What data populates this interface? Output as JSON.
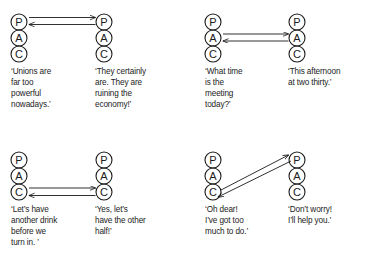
{
  "figure": {
    "background_color": "#ffffff",
    "stroke_color": "#1a1a1a",
    "ego_states": [
      "P",
      "A",
      "C"
    ],
    "ego_state_names": {
      "P": "Parent",
      "A": "Adult",
      "C": "Child"
    }
  },
  "panels": [
    {
      "id": "panel-parent-to-parent",
      "transaction_type": "complementary",
      "arrows": [
        {
          "from": "left-P",
          "to": "right-P",
          "direction": "left-to-right"
        },
        {
          "from": "right-P",
          "to": "left-P",
          "direction": "right-to-left"
        }
      ],
      "left_person": {
        "states": [
          "P",
          "A",
          "C"
        ],
        "caption": "‘Unions are\nfar too\npowerful\nnowadays.’"
      },
      "right_person": {
        "states": [
          "P",
          "A",
          "C"
        ],
        "caption": "‘They certainly\nare. They are\nruining the\neconomy!’"
      }
    },
    {
      "id": "panel-adult-to-adult",
      "transaction_type": "complementary",
      "arrows": [
        {
          "from": "left-A",
          "to": "right-A",
          "direction": "left-to-right"
        },
        {
          "from": "right-A",
          "to": "left-A",
          "direction": "right-to-left"
        }
      ],
      "left_person": {
        "states": [
          "P",
          "A",
          "C"
        ],
        "caption": "‘What time\nis the\nmeeting\ntoday?’"
      },
      "right_person": {
        "states": [
          "P",
          "A",
          "C"
        ],
        "caption": "‘This afternoon\nat two thirty.’"
      }
    },
    {
      "id": "panel-child-to-child",
      "transaction_type": "complementary",
      "arrows": [
        {
          "from": "left-C",
          "to": "right-C",
          "direction": "left-to-right"
        },
        {
          "from": "right-C",
          "to": "left-C",
          "direction": "right-to-left"
        }
      ],
      "left_person": {
        "states": [
          "P",
          "A",
          "C"
        ],
        "caption": "‘Let’s have\nanother drink\nbefore we\nturn in. ’"
      },
      "right_person": {
        "states": [
          "P",
          "A",
          "C"
        ],
        "caption": "‘Yes, let’s\nhave the other\nhalf!’"
      }
    },
    {
      "id": "panel-child-to-parent",
      "transaction_type": "complementary-crossed-diagonal",
      "arrows": [
        {
          "from": "left-C",
          "to": "right-P",
          "direction": "diagonal-up-right"
        },
        {
          "from": "right-P",
          "to": "left-C",
          "direction": "diagonal-down-left"
        }
      ],
      "left_person": {
        "states": [
          "P",
          "A",
          "C"
        ],
        "caption": "‘Oh dear!\nI’ve got too\nmuch to do.’"
      },
      "right_person": {
        "states": [
          "P",
          "A",
          "C"
        ],
        "caption": "‘Don’t worry!\nI’ll help you.’"
      }
    }
  ]
}
